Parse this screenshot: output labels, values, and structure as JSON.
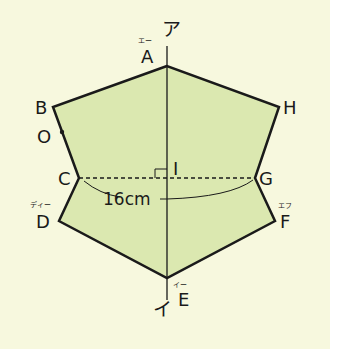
{
  "diagram": {
    "colors": {
      "background": "#f7f8de",
      "fill": "#dbe8b0",
      "stroke": "#1a1a1a"
    },
    "axis": {
      "top_label": "ア",
      "bottom_label": "イ"
    },
    "vertices": {
      "A": {
        "label": "A",
        "ruby": "エー"
      },
      "B": {
        "label": "B",
        "ruby": ""
      },
      "C": {
        "label": "C",
        "ruby": ""
      },
      "D": {
        "label": "D",
        "ruby": "ディー"
      },
      "E": {
        "label": "E",
        "ruby": "イー"
      },
      "F": {
        "label": "F",
        "ruby": "エフ"
      },
      "G": {
        "label": "G",
        "ruby": ""
      },
      "H": {
        "label": "H",
        "ruby": ""
      }
    },
    "point_O": {
      "label": "O"
    },
    "point_I": {
      "label": "I"
    },
    "measurement": {
      "label": "16cm",
      "segment": "CG"
    }
  }
}
